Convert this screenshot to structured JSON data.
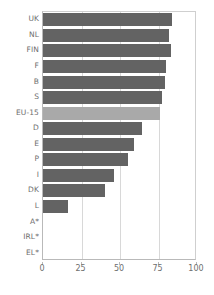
{
  "chart_data": {
    "type": "bar",
    "orientation": "horizontal",
    "title": "",
    "subtitle": "",
    "xlabel": "",
    "ylabel": "",
    "xlim": [
      0,
      100
    ],
    "xticks": [
      0,
      25,
      50,
      75,
      100
    ],
    "xtick_labels": [
      "0",
      "25",
      "50",
      "75",
      "100"
    ],
    "grid": true,
    "grid_axis": "x",
    "legend": false,
    "legend_position": "none",
    "highlight_category": "EU-15",
    "categories": [
      "UK",
      "NL",
      "FIN",
      "F",
      "B",
      "S",
      "EU-15",
      "D",
      "E",
      "P",
      "I",
      "DK",
      "L",
      "A*",
      "IRL*",
      "EL*"
    ],
    "values": [
      84,
      82,
      83,
      80,
      79,
      77,
      76,
      64,
      59,
      55,
      46,
      40,
      16,
      0,
      0,
      0
    ],
    "bars": [
      {
        "label": "UK",
        "value": 84,
        "highlight": false
      },
      {
        "label": "NL",
        "value": 82,
        "highlight": false
      },
      {
        "label": "FIN",
        "value": 83,
        "highlight": false
      },
      {
        "label": "F",
        "value": 80,
        "highlight": false
      },
      {
        "label": "B",
        "value": 79,
        "highlight": false
      },
      {
        "label": "S",
        "value": 77,
        "highlight": false
      },
      {
        "label": "EU-15",
        "value": 76,
        "highlight": true
      },
      {
        "label": "D",
        "value": 64,
        "highlight": false
      },
      {
        "label": "E",
        "value": 59,
        "highlight": false
      },
      {
        "label": "P",
        "value": 55,
        "highlight": false
      },
      {
        "label": "I",
        "value": 46,
        "highlight": false
      },
      {
        "label": "DK",
        "value": 40,
        "highlight": false
      },
      {
        "label": "L",
        "value": 16,
        "highlight": false
      },
      {
        "label": "A*",
        "value": 0,
        "highlight": false
      },
      {
        "label": "IRL*",
        "value": 0,
        "highlight": false
      },
      {
        "label": "EL*",
        "value": 0,
        "highlight": false
      }
    ]
  },
  "colors": {
    "bar": "#636363",
    "bar_highlight": "#a9a9a9",
    "gridline": "#d8d8d8",
    "axis": "#b9b9b9",
    "text": "#6e6e6e",
    "background": "#ffffff"
  }
}
